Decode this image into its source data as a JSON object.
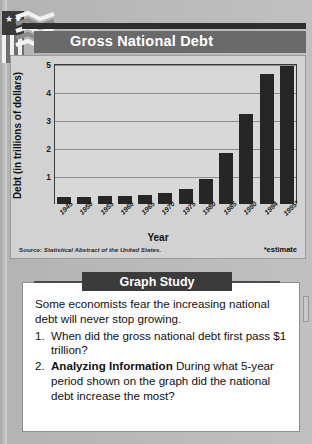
{
  "logo": {
    "name": "us-flag-logo",
    "stars": [
      "★",
      "★"
    ]
  },
  "header": {
    "title": "Gross National Debt"
  },
  "chart_data": {
    "type": "bar",
    "title": "Gross National Debt",
    "xlabel": "Year",
    "ylabel": "Debt (in trillions of dollars)",
    "ylim": [
      0,
      5
    ],
    "yticks": [
      "1",
      "2",
      "3",
      "4",
      "5"
    ],
    "grid": true,
    "legend": "none",
    "categories": [
      "1945",
      "1950",
      "1955",
      "1960",
      "1965",
      "1970",
      "1975",
      "1980",
      "1985",
      "1990",
      "1994",
      "1995*"
    ],
    "values": [
      0.26,
      0.26,
      0.27,
      0.29,
      0.32,
      0.38,
      0.54,
      0.91,
      1.82,
      3.23,
      4.64,
      4.92
    ],
    "source": "Source: Statistical Abstract of the United States.",
    "source_label": "Source:",
    "source_italic": "Statistical Abstract of the United States.",
    "footnote": "*estimate"
  },
  "graph_study": {
    "banner": "Graph Study",
    "intro": "Some economists fear the increasing national debt will never stop growing.",
    "questions": [
      {
        "num": "1.",
        "bold": "",
        "text": "When did the gross national debt first pass $1 trillion?"
      },
      {
        "num": "2.",
        "bold": "Analyzing Information",
        "text": "  During what 5-year period shown on the graph did the national debt increase the most?"
      }
    ]
  }
}
